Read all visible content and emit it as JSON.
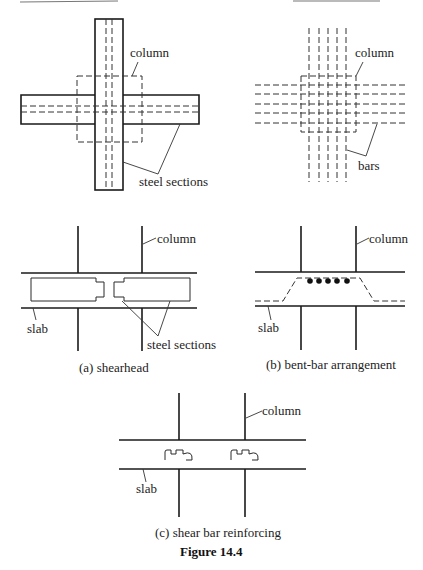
{
  "figure": {
    "title": "Figure 14.4",
    "panels": [
      {
        "id": "a",
        "caption": "(a)  shearhead",
        "plan_labels": {
          "column": "column",
          "steel": "steel sections"
        },
        "section_labels": {
          "column": "column",
          "slab": "slab",
          "steel": "steel sections"
        }
      },
      {
        "id": "b",
        "caption": "(b)  bent-bar arrangement",
        "plan_labels": {
          "column": "column",
          "bars": "bars"
        },
        "section_labels": {
          "column": "column",
          "slab": "slab"
        },
        "bar_dots": 5
      },
      {
        "id": "c",
        "caption": "(c)  shear bar reinforcing",
        "section_labels": {
          "column": "column",
          "slab": "slab"
        }
      }
    ]
  },
  "colors": {
    "ink": "#1a1a1a",
    "background": "#ffffff"
  }
}
